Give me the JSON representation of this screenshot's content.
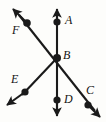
{
  "figure": {
    "kind": "geometry-diagram",
    "background_color": "#fdfdfb",
    "stroke_color": "#1a1a1a",
    "label_color": "#141414",
    "width": 106,
    "height": 122,
    "vertex": {
      "label": "B",
      "x": 57,
      "y": 58
    },
    "points": [
      {
        "label": "A",
        "x": 57,
        "y": 22,
        "label_x": 65,
        "label_y": 14
      },
      {
        "label": "B",
        "x": 57,
        "y": 58,
        "label_x": 63,
        "label_y": 49
      },
      {
        "label": "C",
        "x": 88,
        "y": 105,
        "label_x": 86,
        "label_y": 84
      },
      {
        "label": "D",
        "x": 57,
        "y": 100,
        "label_x": 64,
        "label_y": 93
      },
      {
        "label": "E",
        "x": 25,
        "y": 92,
        "label_x": 11,
        "label_y": 73
      },
      {
        "label": "F",
        "x": 27,
        "y": 23,
        "label_x": 12,
        "label_y": 24
      }
    ],
    "lines": [
      {
        "name": "line-AD",
        "through": [
          "A",
          "B",
          "D"
        ],
        "x1": 57,
        "y1": 9,
        "x2": 57,
        "y2": 115,
        "arrow_start": true,
        "arrow_end": true
      },
      {
        "name": "line-FC",
        "through": [
          "F",
          "B",
          "C"
        ],
        "x1": 14,
        "y1": 10,
        "x2": 99,
        "y2": 116,
        "arrow_start": true,
        "arrow_end": true
      },
      {
        "name": "line-EB",
        "through": [
          "E",
          "B"
        ],
        "x1": 8,
        "y1": 102,
        "x2": 57,
        "y2": 58,
        "arrow_start": true,
        "arrow_end": false
      }
    ]
  }
}
